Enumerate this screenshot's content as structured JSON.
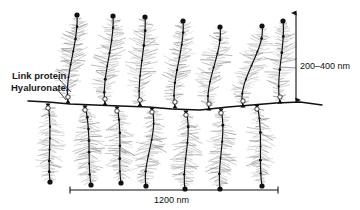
{
  "figure": {
    "background_color": "#ffffff",
    "ink_color": "#111111",
    "bristle_color": "#808080"
  },
  "annotations": {
    "link_protein_label": "Link protein",
    "hyaluronate_label": "Hyaluronate",
    "vertical_scale_label": "200–400 nm",
    "horizontal_scale_label": "1200 nm"
  },
  "structure": {
    "backbone": {
      "name": "hyaluronate-backbone",
      "y_center": 101,
      "x_start": 28,
      "x_end": 322,
      "path": "M28,101 L48,102 L70,104 L95,105 L120,106 L148,107 L172,109 L200,110 L228,107 L252,105 L276,103 L300,102 L322,105"
    },
    "upper_branches": [
      {
        "id": "upper-1",
        "attach_x": 68,
        "attach_y": 103,
        "tip_x": 77,
        "tip_y": 15,
        "curve_dx": -4
      },
      {
        "id": "upper-2",
        "attach_x": 105,
        "attach_y": 105,
        "tip_x": 113,
        "tip_y": 16,
        "curve_dx": -4
      },
      {
        "id": "upper-3",
        "attach_x": 140,
        "attach_y": 106,
        "tip_x": 145,
        "tip_y": 17,
        "curve_dx": -4
      },
      {
        "id": "upper-4",
        "attach_x": 175,
        "attach_y": 108,
        "tip_x": 183,
        "tip_y": 21,
        "curve_dx": -5
      },
      {
        "id": "upper-5",
        "attach_x": 209,
        "attach_y": 110,
        "tip_x": 220,
        "tip_y": 27,
        "curve_dx": -6
      },
      {
        "id": "upper-6",
        "attach_x": 243,
        "attach_y": 107,
        "tip_x": 262,
        "tip_y": 26,
        "curve_dx": -7
      },
      {
        "id": "upper-7",
        "attach_x": 280,
        "attach_y": 103,
        "tip_x": 283,
        "tip_y": 21,
        "curve_dx": -5
      }
    ],
    "lower_branches": [
      {
        "id": "lower-1",
        "attach_x": 48,
        "attach_y": 104,
        "tip_x": 50,
        "tip_y": 182,
        "curve_dx": 5
      },
      {
        "id": "lower-2",
        "attach_x": 85,
        "attach_y": 106,
        "tip_x": 91,
        "tip_y": 185,
        "curve_dx": 7
      },
      {
        "id": "lower-3",
        "attach_x": 117,
        "attach_y": 107,
        "tip_x": 121,
        "tip_y": 183,
        "curve_dx": 6
      },
      {
        "id": "lower-4",
        "attach_x": 152,
        "attach_y": 108,
        "tip_x": 146,
        "tip_y": 186,
        "curve_dx": 7
      },
      {
        "id": "lower-5",
        "attach_x": 186,
        "attach_y": 111,
        "tip_x": 185,
        "tip_y": 189,
        "curve_dx": 7
      },
      {
        "id": "lower-6",
        "attach_x": 221,
        "attach_y": 109,
        "tip_x": 220,
        "tip_y": 189,
        "curve_dx": 6
      },
      {
        "id": "lower-7",
        "attach_x": 257,
        "attach_y": 105,
        "tip_x": 262,
        "tip_y": 186,
        "curve_dx": 7
      }
    ],
    "link_protein_circles": [
      {
        "x": 68,
        "y": 97
      },
      {
        "x": 105,
        "y": 99
      },
      {
        "x": 140,
        "y": 100
      },
      {
        "x": 175,
        "y": 102
      },
      {
        "x": 209,
        "y": 104
      },
      {
        "x": 243,
        "y": 101
      },
      {
        "x": 280,
        "y": 97
      },
      {
        "x": 48,
        "y": 108
      },
      {
        "x": 85,
        "y": 110
      },
      {
        "x": 117,
        "y": 111
      },
      {
        "x": 152,
        "y": 112
      },
      {
        "x": 186,
        "y": 115
      },
      {
        "x": 221,
        "y": 113
      },
      {
        "x": 257,
        "y": 109
      }
    ]
  },
  "scale_bars": {
    "vertical": {
      "x": 296,
      "y_top": 13,
      "y_bottom": 100,
      "label": "200–400 nm"
    },
    "horizontal": {
      "y": 190,
      "x_left": 70,
      "x_right": 278,
      "label": "1200 nm"
    }
  }
}
